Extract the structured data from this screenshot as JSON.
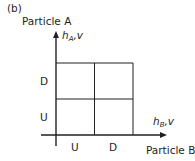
{
  "panel_label": "(b)",
  "axes": {
    "y": {
      "title": "Particle A",
      "variable": "h",
      "subscript": "A",
      "suffix": ",v"
    },
    "x": {
      "title": "Particle B",
      "variable": "h",
      "subscript": "B",
      "suffix": ",v"
    }
  },
  "grid": {
    "rows": [
      "D",
      "U"
    ],
    "cols": [
      "U",
      "D"
    ]
  },
  "colors": {
    "line": "#231f20",
    "text": "#231f20"
  }
}
